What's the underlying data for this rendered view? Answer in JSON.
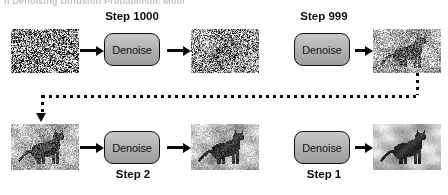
{
  "figure": {
    "top_cut_text": "n Denoising Diffusion Probabilistic Models",
    "kind": "denoising-diffusion-pipeline-diagram"
  },
  "colors": {
    "box_fill": "#b4b4b4",
    "box_stroke": "#111111",
    "arrow": "#0a0a0a",
    "text": "#0d0d0d",
    "background": "#ffffff"
  },
  "rows": [
    {
      "name": "top-row",
      "step_labels": [
        {
          "text": "Step 1000",
          "x": 97,
          "y": 10,
          "width": 70
        },
        {
          "text": "Step 999",
          "x": 289,
          "y": 10,
          "width": 70
        }
      ],
      "boxes": [
        {
          "label": "Denoise",
          "x": 104,
          "y": 33
        },
        {
          "label": "Denoise",
          "x": 294,
          "y": 33
        }
      ],
      "tiles": [
        {
          "name": "image-noise-pure",
          "x": 11,
          "y": 29,
          "w": 68,
          "h": 44,
          "noise": 1.0,
          "cat": 0.0,
          "alt": "pure gaussian noise"
        },
        {
          "name": "image-noisy-cat-faint",
          "x": 191,
          "y": 29,
          "w": 68,
          "h": 44,
          "noise": 0.74,
          "cat": 0.45,
          "alt": "faint cat shape in noise"
        },
        {
          "name": "image-noisy-cat-clearer",
          "x": 373,
          "y": 29,
          "w": 68,
          "h": 44,
          "noise": 0.42,
          "cat": 0.85,
          "alt": "clearer cat in light noise"
        }
      ],
      "arrows": [
        {
          "x": 80,
          "y": 49,
          "w": 17
        },
        {
          "x": 167,
          "y": 49,
          "w": 17
        },
        {
          "x": 355,
          "y": 49,
          "w": 11
        }
      ]
    },
    {
      "name": "bottom-row",
      "step_labels": [
        {
          "text": "Step 2",
          "x": 105,
          "y": 168,
          "width": 56
        },
        {
          "text": "Step 1",
          "x": 296,
          "y": 168,
          "width": 56
        }
      ],
      "boxes": [
        {
          "label": "Denoise",
          "x": 104,
          "y": 131
        },
        {
          "label": "Denoise",
          "x": 294,
          "y": 131
        }
      ],
      "tiles": [
        {
          "name": "image-cat-slight-noise",
          "x": 11,
          "y": 124,
          "w": 68,
          "h": 46,
          "noise": 0.3,
          "cat": 0.95,
          "alt": "cat with slight noise"
        },
        {
          "name": "image-cat-less-noise",
          "x": 191,
          "y": 124,
          "w": 68,
          "h": 46,
          "noise": 0.2,
          "cat": 1.0,
          "alt": "cat with minimal noise"
        },
        {
          "name": "image-cat-clean",
          "x": 373,
          "y": 124,
          "w": 68,
          "h": 46,
          "noise": 0.08,
          "cat": 1.0,
          "alt": "clean cat image"
        }
      ],
      "arrows": [
        {
          "x": 80,
          "y": 146,
          "w": 17
        },
        {
          "x": 167,
          "y": 146,
          "w": 17
        },
        {
          "x": 355,
          "y": 146,
          "w": 11
        }
      ]
    }
  ],
  "feedback_arrow": {
    "name": "feedback-loop-arrow",
    "style": "dotted",
    "vertical_down_right": {
      "x": 416,
      "y": 73,
      "h": 22
    },
    "horizontal": {
      "x": 42,
      "y": 95,
      "w": 377
    },
    "vertical_down_left": {
      "x": 41,
      "y": 95,
      "h": 20
    },
    "head": {
      "x": 36,
      "y": 113
    }
  }
}
